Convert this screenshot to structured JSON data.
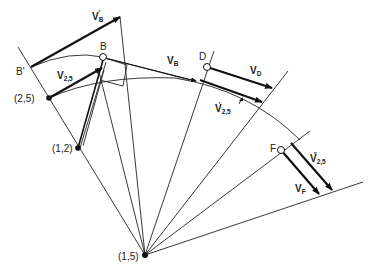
{
  "diagram": {
    "type": "velocity-polygon-construction",
    "labels": {
      "vb_prime": {
        "main": "V",
        "sub": "B",
        "sup": "'"
      },
      "b_point": "B",
      "b_prime": "B'",
      "vb": {
        "main": "V",
        "sub": "B"
      },
      "d_point": "D",
      "vd": {
        "main": "V",
        "sub": "D"
      },
      "v25": {
        "main": "V",
        "sub": "2,5"
      },
      "v25_prime": {
        "main": "V",
        "sub": "2,5",
        "sup": "'"
      },
      "v25_double_prime": {
        "main": "V",
        "sub": "2,5",
        "sup": "\""
      },
      "f_point": "F",
      "vf": {
        "main": "V",
        "sub": "F"
      },
      "pole_25": "(2,5)",
      "pole_12": "(1,2)",
      "pole_15": "(1,5)"
    },
    "points": {
      "pole_15": [
        145,
        255
      ],
      "pole_12": [
        78,
        148
      ],
      "pole_25": [
        49,
        98
      ],
      "B": [
        103,
        57
      ],
      "B_prime": [
        31,
        67
      ],
      "D": [
        207,
        67
      ],
      "F": [
        281,
        150
      ]
    }
  }
}
